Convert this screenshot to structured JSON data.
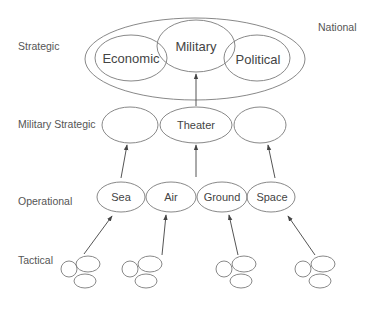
{
  "levels": {
    "national": "National",
    "strategic": "Strategic",
    "military_strategic": "Military Strategic",
    "operational": "Operational",
    "tactical": "Tactical"
  },
  "strategic_nodes": {
    "economic": "Economic",
    "military": "Military",
    "political": "Political"
  },
  "military_strategic_nodes": {
    "left": "",
    "center": "Theater",
    "right": ""
  },
  "operational_nodes": [
    "Sea",
    "Air",
    "Ground",
    "Space"
  ],
  "tactical_clusters": 4,
  "colors": {
    "stroke": "#7a7a7a",
    "text": "#555555",
    "arrow": "#555555"
  }
}
